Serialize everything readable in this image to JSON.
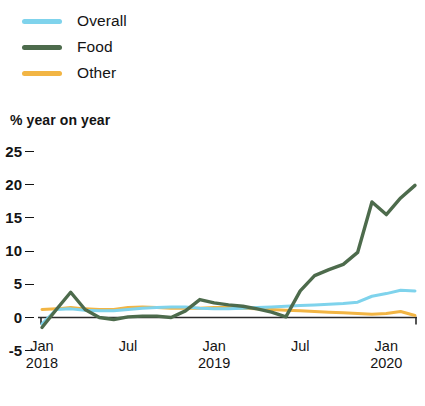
{
  "legend": {
    "items": [
      {
        "label": "Overall",
        "color": "#7FD3EC"
      },
      {
        "label": "Food",
        "color": "#4D6B4C"
      },
      {
        "label": "Other",
        "color": "#F2B544"
      }
    ]
  },
  "axis": {
    "y_title": "% year on year",
    "y_ticks": [
      "25",
      "20",
      "15",
      "10",
      "5",
      "0",
      "-5"
    ],
    "x_ticks": [
      {
        "month": "Jan",
        "year": "2018"
      },
      {
        "month": "Jul",
        "year": ""
      },
      {
        "month": "Jan",
        "year": "2019"
      },
      {
        "month": "Jul",
        "year": ""
      },
      {
        "month": "Jan",
        "year": "2020"
      }
    ]
  },
  "chart_data": {
    "type": "line",
    "title": "",
    "xlabel": "",
    "ylabel": "% year on year",
    "ylim": [
      -5,
      25
    ],
    "yticks": [
      -5,
      0,
      5,
      10,
      15,
      20,
      25
    ],
    "grid": false,
    "legend_position": "top-left",
    "zero_line": true,
    "x": [
      "2018-01",
      "2018-02",
      "2018-03",
      "2018-04",
      "2018-05",
      "2018-06",
      "2018-07",
      "2018-08",
      "2018-09",
      "2018-10",
      "2018-11",
      "2018-12",
      "2019-01",
      "2019-02",
      "2019-03",
      "2019-04",
      "2019-05",
      "2019-06",
      "2019-07",
      "2019-08",
      "2019-09",
      "2019-10",
      "2019-11",
      "2019-12",
      "2020-01",
      "2020-02",
      "2020-03"
    ],
    "xtick_labels": [
      "Jan 2018",
      "Jul",
      "Jan 2019",
      "Jul",
      "Jan 2020"
    ],
    "xtick_index": [
      0,
      6,
      12,
      18,
      24
    ],
    "series": [
      {
        "name": "Overall",
        "color": "#7FD3EC",
        "values": [
          -1.0,
          1.2,
          1.3,
          1.1,
          1.0,
          1.0,
          1.2,
          1.4,
          1.5,
          1.6,
          1.6,
          1.4,
          1.3,
          1.3,
          1.4,
          1.5,
          1.6,
          1.7,
          1.8,
          1.9,
          2.0,
          2.1,
          2.3,
          3.2,
          3.6,
          4.1,
          4.0
        ]
      },
      {
        "name": "Food",
        "color": "#4D6B4C",
        "values": [
          -1.5,
          1.2,
          3.8,
          1.2,
          0.0,
          -0.3,
          0.1,
          0.2,
          0.2,
          0.0,
          1.0,
          2.7,
          2.2,
          1.9,
          1.7,
          1.3,
          0.8,
          0.1,
          4.0,
          6.3,
          7.2,
          8.0,
          9.8,
          17.4,
          15.5,
          18.0,
          19.9
        ]
      },
      {
        "name": "Other",
        "color": "#F2B544",
        "values": [
          1.2,
          1.3,
          1.5,
          1.3,
          1.2,
          1.2,
          1.5,
          1.6,
          1.5,
          1.4,
          1.4,
          1.4,
          1.5,
          1.5,
          1.4,
          1.3,
          1.2,
          1.1,
          1.0,
          0.9,
          0.8,
          0.7,
          0.6,
          0.5,
          0.6,
          0.9,
          0.3
        ]
      }
    ]
  }
}
